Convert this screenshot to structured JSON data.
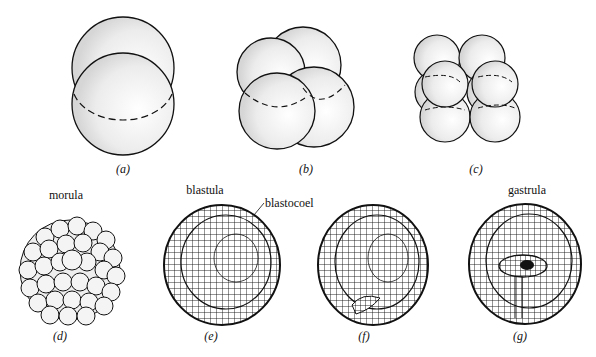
{
  "figure": {
    "panels": [
      {
        "id": "a",
        "caption": "(a)",
        "label": "",
        "description": "two-cell stage"
      },
      {
        "id": "b",
        "caption": "(b)",
        "label": "",
        "description": "four-cell stage"
      },
      {
        "id": "c",
        "caption": "(c)",
        "label": "",
        "description": "eight-cell stage"
      },
      {
        "id": "d",
        "caption": "(d)",
        "label": "morula",
        "description": "solid ball of cells"
      },
      {
        "id": "e",
        "caption": "(e)",
        "label": "blastula",
        "description": "hollow sphere with blastocoel"
      },
      {
        "id": "f",
        "caption": "(f)",
        "label": "",
        "description": "beginning of invagination"
      },
      {
        "id": "g",
        "caption": "(g)",
        "label": "gastrula",
        "description": "invaginated gastrula"
      }
    ],
    "annotations": {
      "blastocoel": "blastocoel"
    }
  },
  "colors": {
    "line": "#111111",
    "shade": "#d9d9d9",
    "background": "#ffffff"
  }
}
